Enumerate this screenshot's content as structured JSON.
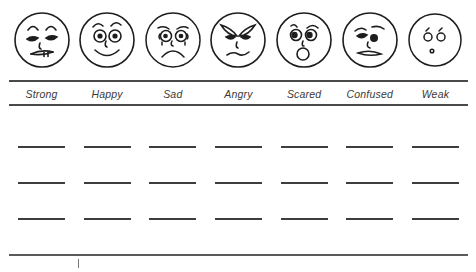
{
  "worksheet": {
    "title": "Emotion Faces Vocabulary Worksheet",
    "ink_color": "#2b2b2b",
    "rule_color": "#4a4a4a",
    "background_color": "#ffffff",
    "columns": [
      {
        "label": "Strong",
        "face_icon": "strong-face-icon",
        "lines": [
          "",
          "",
          ""
        ]
      },
      {
        "label": "Happy",
        "face_icon": "happy-face-icon",
        "lines": [
          "",
          "",
          ""
        ]
      },
      {
        "label": "Sad",
        "face_icon": "sad-face-icon",
        "lines": [
          "",
          "",
          ""
        ]
      },
      {
        "label": "Angry",
        "face_icon": "angry-face-icon",
        "lines": [
          "",
          "",
          ""
        ]
      },
      {
        "label": "Scared",
        "face_icon": "scared-face-icon",
        "lines": [
          "",
          "",
          ""
        ]
      },
      {
        "label": "Confused",
        "face_icon": "confused-face-icon",
        "lines": [
          "",
          "",
          ""
        ]
      },
      {
        "label": "Weak",
        "face_icon": "weak-face-icon",
        "lines": [
          "",
          "",
          ""
        ]
      }
    ],
    "answer_rows": 3
  }
}
